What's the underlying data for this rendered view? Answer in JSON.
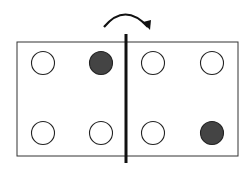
{
  "diagram": {
    "fold_direction": "left-to-right",
    "colors": {
      "outline": "#333333",
      "fold_line": "#111111",
      "hole_fill_punched": "#444444",
      "hole_fill_empty": "#ffffff",
      "arrow": "#111111"
    },
    "card": {
      "x": 17,
      "y": 42,
      "width": 221,
      "height": 114
    },
    "fold_line": {
      "x": 126,
      "y1": 34,
      "y2": 163
    },
    "arrow": {
      "start": [
        104,
        27
      ],
      "control": [
        125,
        2
      ],
      "end": [
        148,
        27
      ]
    },
    "holes": [
      {
        "row": 1,
        "col": 1,
        "cx": 43,
        "cy": 63,
        "filled": false
      },
      {
        "row": 1,
        "col": 2,
        "cx": 101,
        "cy": 63,
        "filled": true
      },
      {
        "row": 1,
        "col": 3,
        "cx": 153,
        "cy": 63,
        "filled": false
      },
      {
        "row": 1,
        "col": 4,
        "cx": 212,
        "cy": 63,
        "filled": false
      },
      {
        "row": 2,
        "col": 1,
        "cx": 43,
        "cy": 133,
        "filled": false
      },
      {
        "row": 2,
        "col": 2,
        "cx": 101,
        "cy": 133,
        "filled": false
      },
      {
        "row": 2,
        "col": 3,
        "cx": 153,
        "cy": 133,
        "filled": false
      },
      {
        "row": 2,
        "col": 4,
        "cx": 212,
        "cy": 133,
        "filled": true
      }
    ],
    "hole_radius": 11.5
  }
}
